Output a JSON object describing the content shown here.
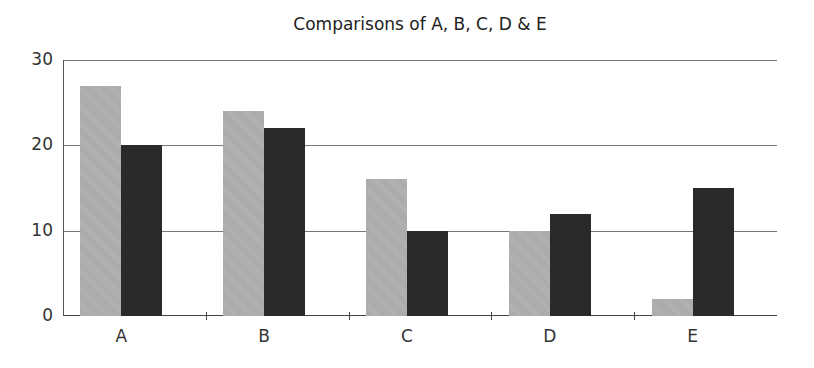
{
  "chart_data": {
    "type": "bar",
    "title": "Comparisons of A, B, C, D & E",
    "categories": [
      "A",
      "B",
      "C",
      "D",
      "E"
    ],
    "series": [
      {
        "name": "Series 1",
        "color": "#aeaeae",
        "values": [
          27,
          24,
          16,
          10,
          2
        ]
      },
      {
        "name": "Series 2",
        "color": "#2a2a2a",
        "values": [
          20,
          22,
          10,
          12,
          15
        ]
      }
    ],
    "xlabel": "",
    "ylabel": "",
    "ylim": [
      0,
      30
    ],
    "yticks": [
      "0",
      "10",
      "20",
      "30"
    ],
    "grid": true,
    "legend": "none"
  }
}
